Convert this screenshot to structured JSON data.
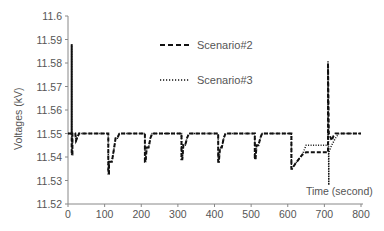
{
  "chart_data": {
    "type": "line",
    "title": "",
    "xlabel": "Time (second)",
    "ylabel": "Voltages (kV)",
    "xlim": [
      0,
      800
    ],
    "ylim": [
      11.52,
      11.6
    ],
    "xticks": [
      0,
      100,
      200,
      300,
      400,
      500,
      600,
      700,
      800
    ],
    "yticks": [
      11.52,
      11.53,
      11.54,
      11.55,
      11.56,
      11.57,
      11.58,
      11.59,
      11.6
    ],
    "xtick_labels": [
      "0",
      "100",
      "200",
      "300",
      "400",
      "500",
      "600",
      "700",
      "800"
    ],
    "ytick_labels": [
      "11.52",
      "11.53",
      "11.54",
      "11.55",
      "11.56",
      "11.57",
      "11.58",
      "11.59",
      "11.6"
    ],
    "grid": false,
    "legend_position": "upper center",
    "series": [
      {
        "name": "Scenario#2",
        "style": "dashed",
        "x": [
          0,
          10,
          10,
          10,
          12,
          12,
          20,
          22,
          30,
          110,
          110,
          112,
          112,
          120,
          125,
          125,
          130,
          135,
          140,
          210,
          210,
          212,
          215,
          220,
          225,
          230,
          310,
          310,
          312,
          315,
          320,
          325,
          330,
          410,
          410,
          412,
          415,
          420,
          425,
          430,
          510,
          510,
          512,
          515,
          520,
          525,
          530,
          610,
          610,
          612,
          620,
          630,
          640,
          650,
          710,
          710,
          712,
          715,
          720,
          725,
          730,
          800
        ],
        "y": [
          11.55,
          11.55,
          11.588,
          11.541,
          11.541,
          11.55,
          11.55,
          11.547,
          11.55,
          11.55,
          11.533,
          11.533,
          11.538,
          11.538,
          11.543,
          11.543,
          11.548,
          11.548,
          11.55,
          11.55,
          11.538,
          11.538,
          11.544,
          11.544,
          11.548,
          11.55,
          11.55,
          11.539,
          11.539,
          11.545,
          11.545,
          11.548,
          11.55,
          11.55,
          11.538,
          11.538,
          11.544,
          11.544,
          11.548,
          11.55,
          11.55,
          11.539,
          11.539,
          11.545,
          11.545,
          11.548,
          11.55,
          11.55,
          11.535,
          11.535,
          11.537,
          11.539,
          11.541,
          11.542,
          11.542,
          11.58,
          11.55,
          11.549,
          11.547,
          11.549,
          11.55,
          11.55
        ]
      },
      {
        "name": "Scenario#3",
        "style": "dotted",
        "x": [
          0,
          10,
          10,
          10,
          12,
          12,
          20,
          22,
          30,
          110,
          110,
          112,
          112,
          120,
          125,
          125,
          130,
          135,
          140,
          210,
          210,
          212,
          215,
          220,
          225,
          230,
          310,
          310,
          312,
          315,
          320,
          325,
          330,
          410,
          410,
          412,
          415,
          420,
          425,
          430,
          510,
          510,
          512,
          515,
          520,
          525,
          530,
          610,
          610,
          612,
          620,
          630,
          640,
          650,
          710,
          710,
          712,
          712,
          720,
          730,
          740,
          800
        ],
        "y": [
          11.55,
          11.55,
          11.588,
          11.541,
          11.541,
          11.55,
          11.55,
          11.547,
          11.55,
          11.55,
          11.533,
          11.533,
          11.538,
          11.538,
          11.543,
          11.543,
          11.548,
          11.548,
          11.55,
          11.55,
          11.538,
          11.538,
          11.544,
          11.544,
          11.548,
          11.55,
          11.55,
          11.539,
          11.539,
          11.545,
          11.545,
          11.548,
          11.55,
          11.55,
          11.538,
          11.538,
          11.544,
          11.544,
          11.548,
          11.55,
          11.55,
          11.539,
          11.539,
          11.545,
          11.545,
          11.548,
          11.55,
          11.55,
          11.535,
          11.535,
          11.537,
          11.539,
          11.541,
          11.545,
          11.545,
          11.581,
          11.528,
          11.542,
          11.545,
          11.548,
          11.55,
          11.55
        ]
      }
    ]
  }
}
